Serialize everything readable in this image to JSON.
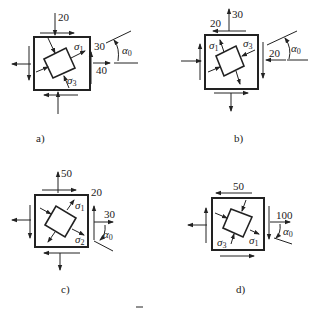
{
  "figure": {
    "panels": [
      {
        "id": "a",
        "caption": "a)",
        "normal_top": "20",
        "shear_right": "30",
        "normal_right": "40",
        "principal_labels": [
          "σ1",
          "σ3"
        ],
        "angle_label": "α0"
      },
      {
        "id": "b",
        "caption": "b)",
        "normal_top": "30",
        "shear_top": "20",
        "normal_right": "20",
        "principal_labels": [
          "σ1",
          "σ3"
        ],
        "angle_label": "α0"
      },
      {
        "id": "c",
        "caption": "c)",
        "normal_top": "50",
        "shear_right": "20",
        "normal_right": "30",
        "principal_labels": [
          "σ1",
          "σ2"
        ],
        "angle_label": "α0"
      },
      {
        "id": "d",
        "caption": "d)",
        "shear_top": "50",
        "normal_right": "100",
        "principal_labels": [
          "σ3",
          "σ1"
        ],
        "angle_label": "α0"
      }
    ],
    "sym": {
      "sigma": "σ",
      "alpha": "α",
      "sub0": "0",
      "sub1": "1",
      "sub2": "2",
      "sub3": "3"
    }
  }
}
